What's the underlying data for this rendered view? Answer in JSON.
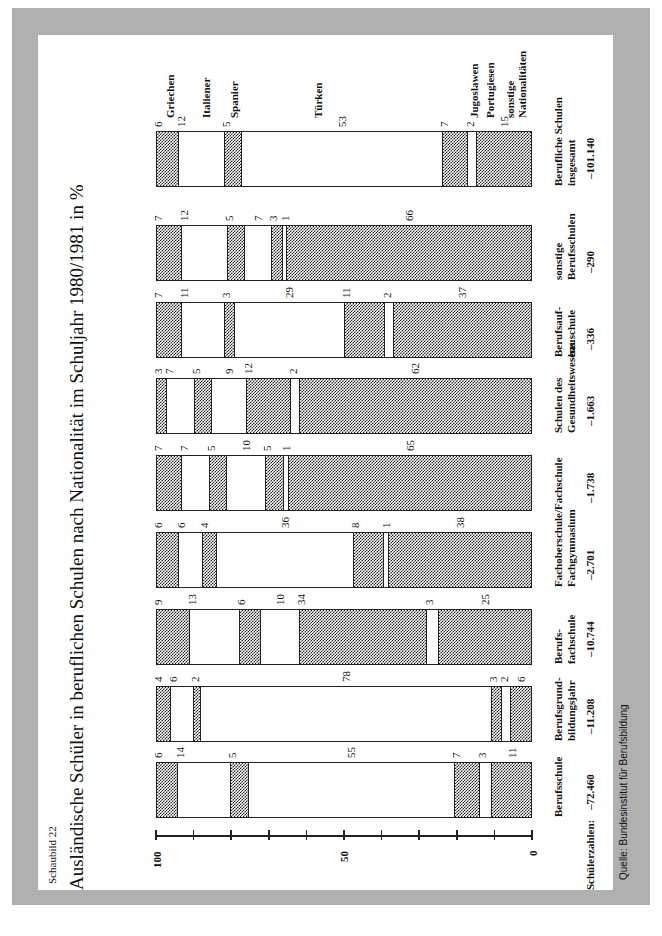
{
  "header": {
    "kicker": "Schaubild 22",
    "title": "Ausländische Schüler in beruflichen Schulen nach Nationalität im Schuljahr 1980/1981 in %"
  },
  "footer": {
    "source": "Quelle: Bundesinstitut für Berufsbildung",
    "counts_label": "Schülerzahlen:"
  },
  "axis": {
    "ticks": [
      "100",
      "50",
      "0"
    ]
  },
  "legend": [
    "Griechen",
    "Italiener",
    "Spanier",
    "Türken",
    "Jugoslawen",
    "Portugiesen",
    "sonstige Nationalitäten"
  ],
  "colors": {
    "hatched": "#222222",
    "frame": "#b0b0b0",
    "panel": "#ffffff"
  },
  "chart_data": {
    "type": "bar",
    "stacked": true,
    "orientation": "rotated 90° (text reads bottom-to-top); 100% stacked bars",
    "title": "Ausländische Schüler in beruflichen Schulen nach Nationalität im Schuljahr 1980/1981 in %",
    "ylabel": "%",
    "ylim": [
      0,
      100
    ],
    "yticks": [
      0,
      10,
      20,
      30,
      40,
      50,
      60,
      70,
      80,
      90,
      100
    ],
    "ytick_labels": [
      "0",
      "50",
      "100"
    ],
    "categories": [
      "Berufsschule",
      "Berufsgrund-bildungsjahr",
      "Berufs-fachschule",
      "Fachoberschule/Fachgymnasium",
      "Fachschule",
      "Schulen des Gesundheitswesens",
      "Berufsaufbauschule",
      "sonstige Berufsschulen",
      "Berufliche Schulen insgesamt"
    ],
    "student_counts": [
      "72.460",
      "11.208",
      "10.744",
      "2.701",
      "1.738",
      "1.663",
      "336",
      "290",
      "101.140"
    ],
    "series": [
      {
        "name": "Griechen",
        "pattern": "hatched",
        "values": [
          6,
          4,
          9,
          6,
          7,
          3,
          7,
          7,
          6
        ]
      },
      {
        "name": "Italiener",
        "pattern": "white",
        "values": [
          14,
          6,
          13,
          6,
          7,
          7,
          11,
          12,
          12
        ]
      },
      {
        "name": "Spanier",
        "pattern": "hatched",
        "values": [
          5,
          2,
          6,
          4,
          5,
          5,
          3,
          5,
          5
        ]
      },
      {
        "name": "Türken",
        "pattern": "white",
        "values": [
          55,
          78,
          10,
          36,
          10,
          9,
          29,
          7,
          53
        ]
      },
      {
        "name": "Jugoslawen",
        "pattern": "hatched",
        "values": [
          7,
          3,
          34,
          8,
          5,
          12,
          11,
          3,
          7
        ]
      },
      {
        "name": "Portugiesen",
        "pattern": "white",
        "values": [
          3,
          2,
          3,
          1,
          1,
          2,
          2,
          1,
          2
        ]
      },
      {
        "name": "sonstige Nationalitäten",
        "pattern": "hatched",
        "values": [
          11,
          6,
          25,
          38,
          65,
          62,
          37,
          66,
          15
        ]
      }
    ],
    "legend_position": "right of last bar (top of screen)",
    "grid": false,
    "source": "Quelle: Bundesinstitut für Berufsbildung"
  },
  "bars": [
    {
      "cat1": "Berufsschule",
      "cat2": "",
      "count": "–72.460",
      "values": [
        "6",
        "14",
        "5",
        "55",
        "7",
        "3",
        "11"
      ]
    },
    {
      "cat1": "Berufsgrund-",
      "cat2": "bildungsjahr",
      "count": "–11.208",
      "values": [
        "4",
        "6",
        "2",
        "78",
        "3",
        "2",
        "6"
      ]
    },
    {
      "cat1": "Berufs-",
      "cat2": "fachschule",
      "count": "–10.744",
      "values": [
        "9",
        "13",
        "6",
        "10",
        "34",
        "3",
        "25"
      ]
    },
    {
      "cat1": "Fachoberschule/",
      "cat2": "Fachgymnasium",
      "count": "–2.701",
      "values": [
        "6",
        "6",
        "4",
        "36",
        "8",
        "1",
        "38"
      ]
    },
    {
      "cat1": "Fachschule",
      "cat2": "",
      "count": "–1.738",
      "values": [
        "7",
        "7",
        "5",
        "10",
        "5",
        "1",
        "65"
      ]
    },
    {
      "cat1": "Schulen des",
      "cat2": "Gesundheitswesens",
      "count": "–1.663",
      "values": [
        "3",
        "7",
        "5",
        "9",
        "12",
        "2",
        "62"
      ]
    },
    {
      "cat1": "Berufsauf-",
      "cat2": "bauschule",
      "count": "–336",
      "values": [
        "7",
        "11",
        "3",
        "29",
        "11",
        "2",
        "37"
      ]
    },
    {
      "cat1": "sonstige",
      "cat2": "Berufsschulen",
      "count": "–290",
      "values": [
        "7",
        "12",
        "5",
        "7",
        "3",
        "1",
        "66"
      ]
    },
    {
      "cat1": "Berufliche Schulen",
      "cat2": "insgesamt",
      "count": "–101.140",
      "values": [
        "6",
        "12",
        "5",
        "53",
        "7",
        "2",
        "15"
      ]
    }
  ]
}
